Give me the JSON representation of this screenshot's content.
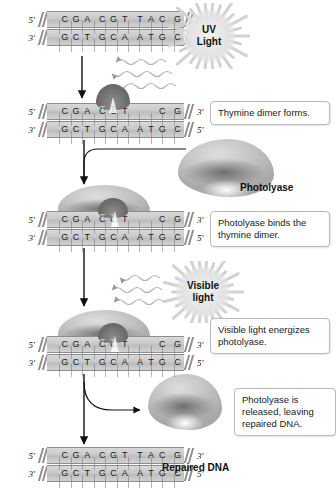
{
  "diagram": {
    "colors": {
      "dna_band": "#c9c9c9",
      "dimer": "#6f6f6f",
      "protein": "#c2c2c2",
      "burst": "#e3e3e3",
      "text": "#1a1a1a",
      "box_border": "#b9b9b9"
    }
  },
  "dna_steps": [
    {
      "id": "intact-dna",
      "top_label_left": "5'",
      "top_label_right": "3'",
      "bottom_label_left": "3'",
      "bottom_label_right": "5'",
      "top_sequence": "CGA CGT TAC G",
      "bottom_sequence": "GCT GCA ATG C",
      "has_dimer": false
    },
    {
      "id": "dimer-dna",
      "top_label_left": "5'",
      "top_label_right": "3'",
      "bottom_label_left": "3'",
      "bottom_label_right": "5'",
      "top_sequence": "CGA CGT TAC G",
      "bottom_sequence": "GCT GCA ATG C",
      "has_dimer": true,
      "dimer_bases": "TT"
    },
    {
      "id": "photolyase-bound-dna",
      "top_label_left": "5'",
      "top_label_right": "3'",
      "bottom_label_left": "3'",
      "bottom_label_right": "5'",
      "top_sequence": "CGA CGT TAC G",
      "bottom_sequence": "GCT GCA ATG C",
      "has_dimer": true,
      "dimer_bases": "TT"
    },
    {
      "id": "energized-dna",
      "top_label_left": "5'",
      "top_label_right": "3'",
      "bottom_label_left": "3'",
      "bottom_label_right": "5'",
      "top_sequence": "CGA CGT TAC G",
      "bottom_sequence": "GCT GCA ATG C",
      "has_dimer": true,
      "dimer_bases": "TT"
    },
    {
      "id": "repaired-dna",
      "top_label_left": "5'",
      "top_label_right": "3'",
      "bottom_label_left": "3'",
      "bottom_label_right": "5'",
      "top_sequence": "CGA CGT TAC G",
      "bottom_sequence": "GCT GCA ATG C",
      "has_dimer": false
    }
  ],
  "light_sources": [
    {
      "id": "uv-light",
      "line1": "UV",
      "line2": "Light"
    },
    {
      "id": "visible-light",
      "line1": "Visible",
      "line2": "light"
    }
  ],
  "labels": {
    "photolyase": "Photolyase",
    "repaired_dna": "Repaired DNA"
  },
  "callouts": [
    {
      "id": "callout-dimer",
      "text": "Thymine dimer forms."
    },
    {
      "id": "callout-binds",
      "text": "Photolyase binds the thymine dimer."
    },
    {
      "id": "callout-energizes",
      "text": "Visible light energizes photolyase."
    },
    {
      "id": "callout-released",
      "text": "Photolyase is released, leaving repaired DNA."
    }
  ]
}
